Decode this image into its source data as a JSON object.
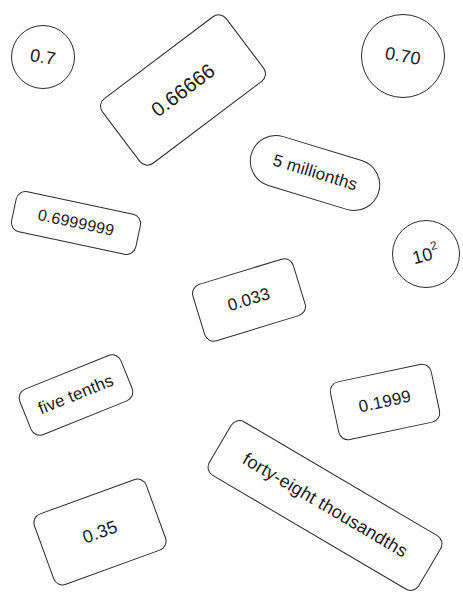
{
  "cards": [
    {
      "id": "c1",
      "text": "0.7",
      "shape": "circle"
    },
    {
      "id": "c2",
      "text": "0.66666",
      "shape": "rect"
    },
    {
      "id": "c3",
      "text": "0.70",
      "shape": "circle"
    },
    {
      "id": "c4",
      "text": "5 millionths",
      "shape": "pill"
    },
    {
      "id": "c5",
      "text": "0.6999999",
      "shape": "rect"
    },
    {
      "id": "c6",
      "base": "10",
      "exponent": "2",
      "shape": "circle"
    },
    {
      "id": "c7",
      "text": "0.033",
      "shape": "rect"
    },
    {
      "id": "c8",
      "text": "five tenths",
      "shape": "rect"
    },
    {
      "id": "c9",
      "text": "0.1999",
      "shape": "rect"
    },
    {
      "id": "c10",
      "text": "forty-eight thousandths",
      "shape": "rect"
    },
    {
      "id": "c11",
      "text": "0.35",
      "shape": "rect"
    }
  ]
}
